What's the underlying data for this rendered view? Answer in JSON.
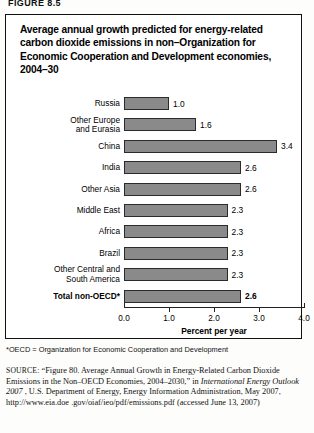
{
  "figure_number": "FIGURE 8.5",
  "title": "Average annual growth predicted for energy-related carbon dioxide emissions in non–Organization for Economic Cooperation and Development economies, 2004–30",
  "footnote": "*OECD = Organization for Economic Cooperation and Development",
  "source": {
    "label": "SOURCE:",
    "part1": " “Figure 80. Average Annual Growth in Energy-Related Carbon Dioxide Emissions in the Non–OECD Economies, 2004–2030,” in ",
    "italic": "International Energy Outlook 2007",
    "part2": " , U.S. Department of Energy, Energy Information Administration, May 2007, http://www.eia.doe .gov/oiaf/ieo/pdf/emissions.pdf (accessed June 13, 2007)"
  },
  "chart_data": {
    "type": "bar",
    "orientation": "horizontal",
    "title": "Average annual growth predicted for energy-related carbon dioxide emissions in non–Organization for Economic Cooperation and Development economies, 2004–30",
    "xlabel": "Percent per year",
    "ylabel": "",
    "xlim": [
      0.0,
      4.0
    ],
    "xticks": [
      "0.0",
      "1.0",
      "2.0",
      "3.0",
      "4.0"
    ],
    "xtick_values": [
      0.0,
      1.0,
      2.0,
      3.0,
      4.0
    ],
    "grid": false,
    "legend": null,
    "bar_color": "#8a8a8a",
    "bar_edge_color": "#2b2b2b",
    "categories": [
      "Russia",
      "Other Europe\nand Eurasia",
      "China",
      "India",
      "Other Asia",
      "Middle East",
      "Africa",
      "Brazil",
      "Other Central and\nSouth America",
      "Total non-OECD*"
    ],
    "values": [
      1.0,
      1.6,
      3.4,
      2.6,
      2.6,
      2.3,
      2.3,
      2.3,
      2.3,
      2.6
    ],
    "value_labels": [
      "1.0",
      "1.6",
      "3.4",
      "2.6",
      "2.6",
      "2.3",
      "2.3",
      "2.3",
      "2.3",
      "2.6"
    ],
    "emphasized_index": 9
  }
}
